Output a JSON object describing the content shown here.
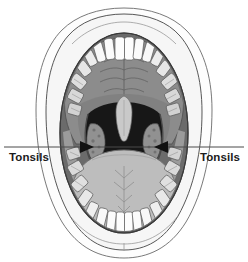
{
  "figure": {
    "canvas": {
      "width": 248,
      "height": 262
    },
    "background_color": "#ffffff"
  },
  "annotations": {
    "leader_line": {
      "name": "tonsil-leader-line",
      "y": 147,
      "x_start": 4,
      "x_end": 244,
      "color": "#4a4a4a",
      "width": 1
    },
    "labels": [
      {
        "id": "left",
        "text": "Tonsils",
        "x": 9,
        "y": 152,
        "align": "left"
      },
      {
        "id": "right",
        "text": "Tonsils",
        "x": 239,
        "y": 152,
        "align": "right"
      }
    ],
    "arrowheads": [
      {
        "id": "left-arrow",
        "x": 88,
        "y": 147,
        "direction": "right",
        "color": "#111111"
      },
      {
        "id": "right-arrow",
        "x": 160,
        "y": 147,
        "direction": "left",
        "color": "#111111"
      }
    ]
  },
  "colors": {
    "background": "#ffffff",
    "outline": "#3c3c3c",
    "skin": "#fbfbfb",
    "lip_fill": "#f4f4f4",
    "mucosa_dark": "#6e6e6e",
    "palate": "#8c8c8c",
    "palate_shadow": "#7a7a7a",
    "gum": "#7b7b7b",
    "tooth": "#fdfdfd",
    "tooth_shade": "#e2e2e2",
    "molar": "#dcdcdc",
    "throat": "#171717",
    "tongue": "#bdbdbd",
    "tongue_edge": "#9a9a9a",
    "uvula": "#c9c9c9",
    "tonsil": "#8f8f8f",
    "pillar": "#c4c4c4",
    "label_text": "#1b1b1b",
    "leader_line": "#4a4a4a",
    "arrow": "#111111"
  },
  "anatomy": {
    "parts": [
      {
        "name": "upper-lip",
        "label": "Upper lip"
      },
      {
        "name": "lower-lip",
        "label": "Lower lip"
      },
      {
        "name": "hard-palate",
        "label": "Hard palate"
      },
      {
        "name": "soft-palate",
        "label": "Soft palate"
      },
      {
        "name": "uvula",
        "label": "Uvula"
      },
      {
        "name": "oropharynx",
        "label": "Oropharynx"
      },
      {
        "name": "tongue",
        "label": "Tongue"
      },
      {
        "name": "upper-teeth",
        "label": "Upper teeth"
      },
      {
        "name": "lower-teeth",
        "label": "Lower teeth"
      },
      {
        "name": "left-tonsil",
        "label": "Tonsil"
      },
      {
        "name": "right-tonsil",
        "label": "Tonsil"
      }
    ],
    "upper_teeth_count": 14,
    "lower_teeth_count": 14
  }
}
